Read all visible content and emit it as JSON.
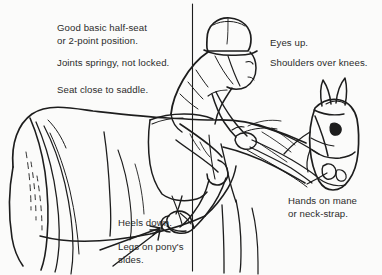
{
  "figure": {
    "title": "Good basic half-seat or 2-point position",
    "background_color": "#fbfbfa",
    "ink_color": "#1d1d1d",
    "text_color": "#2b2b2b",
    "width": 382,
    "height": 275
  },
  "annotations": {
    "half_seat": "Good basic half-seat\nor 2-point position.",
    "joints": "Joints springy, not locked.",
    "seat": "Seat close to saddle.",
    "eyes": "Eyes up.",
    "shoulders": "Shoulders over knees.",
    "heels": "Heels down.",
    "legs": "Legs on pony's\nsides.",
    "hands": "Hands on mane\nor neck-strap."
  },
  "graphics": {
    "plumb_line": "vertical-plumb-line",
    "arrow_heels": "heel-pointer-arrow",
    "arrow_legs": "leg-pointer-arrow",
    "subject_horse": "pony-side-view",
    "subject_rider": "rider-in-half-seat"
  }
}
